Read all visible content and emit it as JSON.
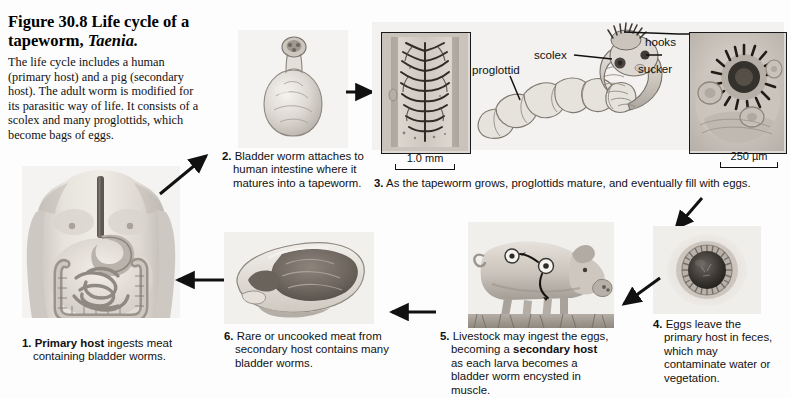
{
  "figure": {
    "number": "Figure 30.8",
    "title_lead": "Life cycle of a tapeworm,",
    "title_italic": "Taenia.",
    "caption": "The life cycle includes a human (primary host) and a pig (secondary host). The adult worm is modified for its parasitic way of life. It consists of a scolex and many proglottids, which become bags of eggs."
  },
  "steps": [
    {
      "number": "1.",
      "bold": "Primary host",
      "rest": " ingests meat containing bladder worms.",
      "full": "1. Primary host ingests meat containing bladder worms."
    },
    {
      "number": "2.",
      "bold": "",
      "rest": "Bladder worm attaches to human intestine where it matures into a tapeworm.",
      "full": "2. Bladder worm attaches to human intestine where it matures into a tapeworm."
    },
    {
      "number": "3.",
      "bold": "",
      "rest": "As the tapeworm grows, proglottids mature, and eventually fill with eggs.",
      "full": "3. As the tapeworm grows, proglottids mature, and eventually fill with eggs."
    },
    {
      "number": "4.",
      "bold": "",
      "rest": "Eggs leave the primary host in feces, which may contaminate water or vegetation.",
      "full": "4. Eggs leave the primary host in feces, which may contaminate water or vegetation."
    },
    {
      "number": "5.",
      "bold": "secondary host",
      "pre": "Livestock may ingest the eggs, becoming a ",
      "post": " as each larva becomes a bladder worm encysted in muscle.",
      "full": "5. Livestock may ingest the eggs, becoming a secondary host as each larva becomes a bladder worm encysted in muscle."
    },
    {
      "number": "6.",
      "bold": "",
      "rest": "Rare or uncooked meat from secondary host contains many bladder worms.",
      "full": "6. Rare or uncooked meat from secondary host contains many bladder worms."
    }
  ],
  "anatomy_labels": {
    "proglottid": "proglottid",
    "scolex": "scolex",
    "hooks": "hooks",
    "sucker": "sucker"
  },
  "scale_bars": {
    "proglottid_micrograph": "1.0 mm",
    "scolex_micrograph": "250 µm"
  },
  "plates": {
    "human": "human-torso-digestive-tract-illustration",
    "bladder_worm": "bladder-worm-illustration",
    "proglottid_micrograph": "proglottid-cross-section-micrograph",
    "tapeworm_drawing": "tapeworm-scolex-and-proglottid-chain-drawing",
    "scolex_micrograph": "scolex-hooks-and-suckers-micrograph",
    "egg": "tapeworm-egg-micrograph",
    "pig": "pig-grazing-with-encysted-larvae-illustration",
    "meat": "raw-pork-ham-cut-illustration"
  },
  "colors": {
    "ink": "#111111",
    "plate_bg": "#f2f1ef",
    "frame": "#1a1a1a",
    "page": "#fdfdfd"
  }
}
